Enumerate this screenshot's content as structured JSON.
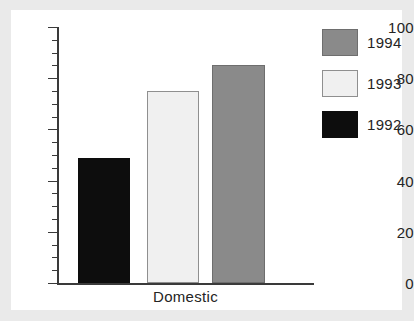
{
  "chart_data": {
    "type": "bar",
    "title": "",
    "subtitle": "",
    "xlabel": "Domestic",
    "ylabel": "",
    "categories": [
      "Domestic"
    ],
    "series": [
      {
        "name": "1992",
        "values": [
          49
        ],
        "color": "#0d0d0d"
      },
      {
        "name": "1993",
        "values": [
          75
        ],
        "color": "#f0f0f0"
      },
      {
        "name": "1994",
        "values": [
          85
        ],
        "color": "#8a8a8a"
      }
    ],
    "ylim": [
      0,
      100
    ],
    "y_major_ticks": [
      0,
      20,
      40,
      60,
      80,
      100
    ],
    "y_minor_tick_step": 5,
    "y_tick_labels": [
      "0",
      "20",
      "40",
      "60",
      "80",
      "100"
    ],
    "grid": false,
    "legend_position": "right",
    "legend_order": [
      "1994",
      "1993",
      "1992"
    ],
    "bar_order_left_to_right": [
      "1992",
      "1993",
      "1994"
    ],
    "axis_color": "#3a3a3a",
    "background_color": "#ffffff",
    "figure_background_color": "#eaeaea"
  },
  "axis": {
    "tick_labels": {
      "t0": "0",
      "t20": "20",
      "t40": "40",
      "t60": "60",
      "t80": "80",
      "t100": "100"
    },
    "x_label": "Domestic"
  },
  "legend": {
    "items": [
      {
        "label": "1994",
        "color": "#8a8a8a",
        "border": "#6e6e6e"
      },
      {
        "label": "1993",
        "color": "#f0f0f0",
        "border": "#8f8f8f"
      },
      {
        "label": "1992",
        "color": "#0d0d0d",
        "border": "#0d0d0d"
      }
    ]
  },
  "bars": [
    {
      "name": "1992",
      "value": 49,
      "color": "#0d0d0d",
      "border": "#0d0d0d",
      "left": 78,
      "width": 52
    },
    {
      "name": "1993",
      "value": 75,
      "color": "#f0f0f0",
      "border": "#8f8f8f",
      "left": 147,
      "width": 52
    },
    {
      "name": "1994",
      "value": 85,
      "color": "#8a8a8a",
      "border": "#6e6e6e",
      "left": 212,
      "width": 53
    }
  ]
}
